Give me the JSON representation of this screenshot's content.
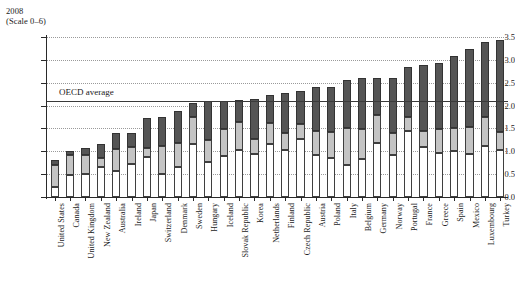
{
  "header": {
    "year": "2008",
    "scale_note": "(Scale 0–6)"
  },
  "annotations": {
    "oecd_average_label": "OECD average"
  },
  "colors": {
    "segment_low": "#ffffff",
    "segment_mid": "#c4c4c4",
    "segment_high": "#555555",
    "axis": "#2a2a2a",
    "gridline": "#9a9a9a",
    "oecd_line": "#3a3a3a"
  },
  "chart_data": {
    "type": "bar",
    "title": "2008",
    "subtitle": "(Scale 0–6)",
    "xlabel": "",
    "ylabel": "",
    "ylim": [
      0.0,
      3.5
    ],
    "ytick_labels": [
      "0.0",
      "0.5",
      "1.0",
      "1.5",
      "2.0",
      "2.5",
      "3.0",
      "3.5"
    ],
    "ytick_values": [
      0.0,
      0.5,
      1.0,
      1.5,
      2.0,
      2.5,
      3.0,
      3.5
    ],
    "grid": true,
    "legend_position": "none",
    "stacked": true,
    "annotations": [
      {
        "name": "OECD average",
        "type": "hline",
        "value": 2.1
      }
    ],
    "categories": [
      "United States",
      "Canada",
      "United Kingdom",
      "New Zealand",
      "Australia",
      "Ireland",
      "Japan",
      "Switzerland",
      "Denmark",
      "Sweden",
      "Hungary",
      "Iceland",
      "Slovak Republic",
      "Korea",
      "Netherlands",
      "Finland",
      "Czech Republic",
      "Austria",
      "Poland",
      "Italy",
      "Belgium",
      "Germany",
      "Norway",
      "Portugal",
      "France",
      "Greece",
      "Spain",
      "Mexico",
      "Luxembourg",
      "Turkey"
    ],
    "series": [
      {
        "name": "low",
        "values": [
          0.23,
          0.48,
          0.5,
          0.66,
          0.57,
          0.72,
          0.87,
          0.51,
          0.66,
          1.15,
          0.77,
          0.9,
          1.02,
          0.95,
          1.15,
          1.02,
          1.26,
          0.93,
          0.86,
          0.71,
          0.83,
          1.19,
          0.93,
          1.45,
          1.1,
          0.97,
          1.01,
          0.95,
          1.12,
          1.03
        ]
      },
      {
        "name": "mid",
        "values": [
          0.46,
          0.44,
          0.42,
          0.2,
          0.47,
          0.37,
          0.2,
          0.6,
          0.52,
          0.59,
          0.47,
          0.58,
          0.62,
          0.33,
          0.47,
          0.38,
          0.33,
          0.51,
          0.56,
          0.79,
          0.65,
          0.61,
          0.47,
          0.31,
          0.34,
          0.51,
          0.5,
          0.58,
          0.63,
          0.39
        ]
      },
      {
        "name": "high",
        "values": [
          0.13,
          0.09,
          0.16,
          0.3,
          0.35,
          0.3,
          0.65,
          0.64,
          0.71,
          0.31,
          0.86,
          0.62,
          0.49,
          0.86,
          0.61,
          0.88,
          0.74,
          0.96,
          0.98,
          1.07,
          1.12,
          0.81,
          1.21,
          1.08,
          1.45,
          1.46,
          1.57,
          1.71,
          1.64,
          2.02
        ]
      }
    ],
    "totals": [
      0.82,
      1.01,
      1.08,
      1.16,
      1.39,
      1.39,
      1.72,
      1.75,
      1.89,
      2.05,
      2.1,
      2.1,
      2.13,
      2.14,
      2.23,
      2.28,
      2.33,
      2.4,
      2.4,
      2.57,
      2.6,
      2.61,
      2.61,
      2.84,
      2.89,
      2.94,
      3.08,
      3.24,
      3.39,
      3.44
    ]
  }
}
